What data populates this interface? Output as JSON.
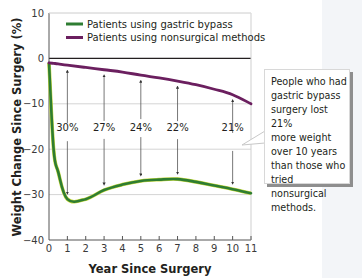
{
  "chart_data": {
    "type": "line",
    "title": "",
    "xlabel": "Year Since Surgery",
    "ylabel": "Weight Change Since Surgery (%)",
    "xlim": [
      0,
      11
    ],
    "ylim": [
      -40,
      10
    ],
    "x_ticks": [
      "0",
      "1",
      "2",
      "3",
      "4",
      "5",
      "6",
      "7",
      "8",
      "9",
      "10",
      "11"
    ],
    "y_ticks": [
      "10",
      "0",
      "-10",
      "-20",
      "-30",
      "-40"
    ],
    "grid": "horizontal",
    "legend_position": "top-inside",
    "x": [
      0,
      0.25,
      0.5,
      1,
      2,
      3,
      4,
      5,
      6,
      7,
      8,
      9,
      10,
      11
    ],
    "series": [
      {
        "name": "Patients using gastric bypass",
        "color": "#2e7d32",
        "values": [
          -1,
          -20,
          -25,
          -31,
          -31,
          -29,
          -27.8,
          -27,
          -26.7,
          -26.6,
          -27.2,
          -28,
          -28.8,
          -29.7
        ]
      },
      {
        "name": "Patients using nonsurgical methods",
        "color": "#6b1f5f",
        "values": [
          -1,
          -1.1,
          -1.2,
          -1.5,
          -2,
          -2.5,
          -3,
          -3.7,
          -4.3,
          -5,
          -5.8,
          -6.8,
          -8,
          -10
        ]
      }
    ],
    "annotations": [
      {
        "x": 1,
        "label": "30%"
      },
      {
        "x": 3,
        "label": "27%"
      },
      {
        "x": 5,
        "label": "24%"
      },
      {
        "x": 7,
        "label": "22%"
      },
      {
        "x": 10,
        "label": "21%"
      }
    ],
    "callout": "People who had gastric bypass surgery lost 21% more weight over 10 years than those who tried nonsurgical methods."
  },
  "legend": {
    "items": [
      {
        "label": "Patients using gastric bypass",
        "color": "#2e7d32"
      },
      {
        "label": "Patients using nonsurgical methods",
        "color": "#6b1f5f"
      }
    ]
  },
  "axes": {
    "xlabel": "Year Since Surgery",
    "ylabel": "Weight Change Since Surgery (%)"
  },
  "callout": {
    "text": "People who had\ngastric bypass\nsurgery lost 21%\nmore weight\nover 10 years\nthan those who\ntried nonsurgical\nmethods."
  }
}
